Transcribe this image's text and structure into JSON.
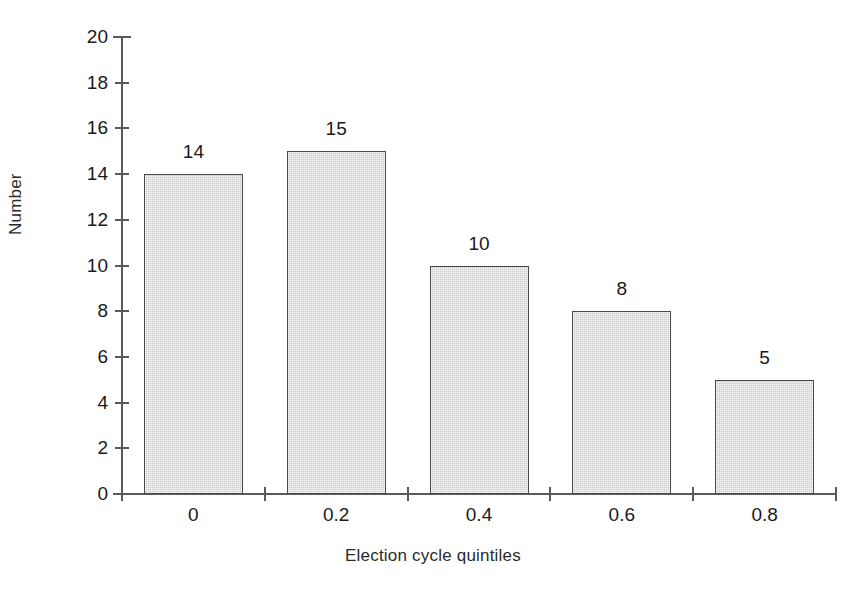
{
  "chart_data": {
    "type": "bar",
    "title": "",
    "categories": [
      "0",
      "0.2",
      "0.4",
      "0.6",
      "0.8"
    ],
    "values": [
      14,
      15,
      10,
      8,
      5
    ],
    "data_labels": [
      "14",
      "15",
      "10",
      "8",
      "5"
    ],
    "xlabel": "Election cycle quintiles",
    "ylabel": "Number",
    "ylim": [
      0,
      20
    ],
    "ytick_labels": [
      "0",
      "2",
      "4",
      "6",
      "8",
      "10",
      "12",
      "14",
      "16",
      "18",
      "20"
    ],
    "ytick_values": [
      0,
      2,
      4,
      6,
      8,
      10,
      12,
      14,
      16,
      18,
      20
    ],
    "xtick_labels": [
      "0",
      "0.2",
      "0.4",
      "0.6",
      "0.8"
    ],
    "grid": false,
    "legend": false,
    "bar_fill_color": "#cacaca",
    "bar_edge_color": "#4a4a4a",
    "axis_color": "#5a5a5a",
    "background_color": "#ffffff"
  }
}
